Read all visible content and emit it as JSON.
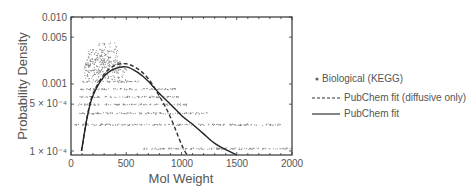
{
  "chart_data": {
    "type": "scatter",
    "title": "",
    "xlabel": "Mol Weight",
    "ylabel": "Probability Density",
    "xlim": [
      0,
      2000
    ],
    "ylim": [
      8.75e-05,
      0.01
    ],
    "yscale": "log",
    "grid": false,
    "legend_position": "right",
    "x_ticks": [
      {
        "value": 0,
        "label": "0"
      },
      {
        "value": 500,
        "label": "500"
      },
      {
        "value": 1000,
        "label": "1000"
      },
      {
        "value": 1500,
        "label": "1500"
      },
      {
        "value": 2000,
        "label": "2000"
      }
    ],
    "y_ticks": [
      {
        "value": 0.0001,
        "label": "1 × 10⁻⁴"
      },
      {
        "value": 0.0005,
        "label": "5 × 10⁻⁴"
      },
      {
        "value": 0.001,
        "label": "0.001"
      },
      {
        "value": 0.005,
        "label": "0.005"
      },
      {
        "value": 0.01,
        "label": "0.010"
      }
    ],
    "series": [
      {
        "name": "Biological (KEGG)",
        "style": "scatter-dots",
        "color": "#888888",
        "description": "Dense cloud of points peaking near MW 300–400 (density ~0.002–0.004), with horizontal bands of points at low densities extending to ~1900",
        "bands": [
          {
            "y": 0.0027,
            "x_range": [
              150,
              420
            ]
          },
          {
            "y": 0.0022,
            "x_range": [
              130,
              450
            ]
          },
          {
            "y": 0.0018,
            "x_range": [
              120,
              480
            ]
          },
          {
            "y": 0.0014,
            "x_range": [
              110,
              500
            ]
          },
          {
            "y": 0.0011,
            "x_range": [
              90,
              620
            ]
          },
          {
            "y": 0.00085,
            "x_range": [
              80,
              950
            ]
          },
          {
            "y": 0.00065,
            "x_range": [
              70,
              980
            ]
          },
          {
            "y": 0.0005,
            "x_range": [
              60,
              1050
            ]
          },
          {
            "y": 0.00037,
            "x_range": [
              50,
              1230
            ]
          },
          {
            "y": 0.00025,
            "x_range": [
              30,
              1900
            ]
          },
          {
            "y": 0.00011,
            "x_range": [
              640,
              2000
            ]
          }
        ]
      },
      {
        "name": "PubChem fit (diffusive only)",
        "style": "dashed",
        "color": "#333333",
        "x": [
          95,
          150,
          200,
          300,
          400,
          500,
          600,
          700,
          800,
          900,
          1000,
          1050
        ],
        "y": [
          0.0001,
          0.00035,
          0.00072,
          0.0014,
          0.0019,
          0.002,
          0.0017,
          0.0012,
          0.00066,
          0.00032,
          0.000125,
          8.75e-05
        ]
      },
      {
        "name": "PubChem fit",
        "style": "solid",
        "color": "#222222",
        "x": [
          95,
          150,
          200,
          300,
          400,
          500,
          600,
          700,
          800,
          900,
          1000,
          1100,
          1200,
          1300,
          1400,
          1500
        ],
        "y": [
          0.0001,
          0.00034,
          0.00068,
          0.0013,
          0.0017,
          0.0018,
          0.0015,
          0.0011,
          0.00072,
          0.0005,
          0.00034,
          0.00025,
          0.00018,
          0.00013,
          0.000105,
          8.75e-05
        ]
      }
    ]
  },
  "legend": {
    "items": [
      {
        "label": "Biological (KEGG)",
        "marker": "dot"
      },
      {
        "label": "PubChem fit (diffusive only)",
        "marker": "dashed-line"
      },
      {
        "label": "PubChem fit",
        "marker": "solid-line"
      }
    ]
  },
  "axes": {
    "x_title": "Mol Weight",
    "y_title": "Probability Density",
    "x_tick_labels": [
      "0",
      "500",
      "1000",
      "1500",
      "2000"
    ],
    "y_tick_labels": [
      "0.010",
      "0.005",
      "0.001",
      "5 × 10⁻⁴",
      "1 × 10⁻⁴"
    ]
  }
}
